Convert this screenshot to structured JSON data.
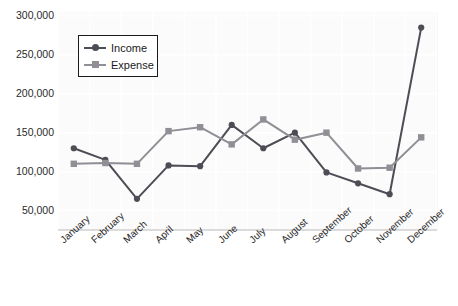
{
  "chart_data": {
    "type": "line",
    "title": "",
    "subtitle": "",
    "xlabel": "",
    "ylabel": "",
    "categories": [
      "January",
      "February",
      "March",
      "April",
      "May",
      "June",
      "July",
      "August",
      "September",
      "October",
      "November",
      "December"
    ],
    "series": [
      {
        "name": "Income",
        "color": "#4d4d55",
        "marker": "circle",
        "values": [
          130000,
          115000,
          65000,
          108000,
          107000,
          160000,
          130000,
          150000,
          99000,
          85000,
          71000,
          285000
        ]
      },
      {
        "name": "Expense",
        "color": "#8f8f95",
        "marker": "square",
        "values": [
          110000,
          111000,
          110000,
          152000,
          157000,
          135000,
          167000,
          141000,
          150000,
          104000,
          105000,
          144000
        ]
      }
    ],
    "ylim": [
      25000,
      305000
    ],
    "yticks": [
      50000,
      100000,
      150000,
      200000,
      250000,
      300000
    ],
    "ytick_labels": [
      "50,000",
      "100,000",
      "150,000",
      "200,000",
      "250,000",
      "300,000"
    ],
    "grid": true,
    "grid_color": "#ffffff",
    "plot_background": "#fbfbfb",
    "legend_position": "upper-left"
  },
  "legend": {
    "entries": [
      {
        "label": "Income"
      },
      {
        "label": "Expense"
      }
    ]
  },
  "top_clipped_text": {
    "left_fragment": "",
    "right_fragment": ""
  }
}
